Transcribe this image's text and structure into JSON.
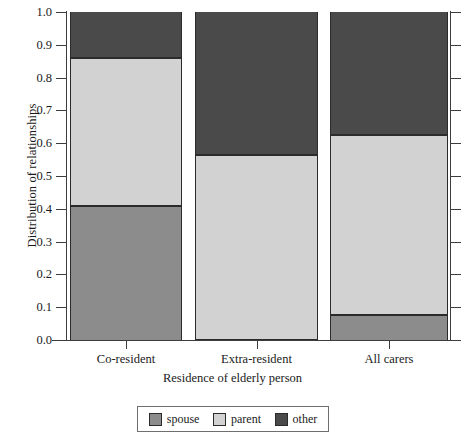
{
  "chart_data": {
    "type": "bar",
    "stacked": true,
    "title": "",
    "xlabel": "Residence of elderly person",
    "ylabel": "Distribution of relationships",
    "categories": [
      "Co-resident",
      "Extra-resident",
      "All carers"
    ],
    "ylim": [
      0.0,
      1.0
    ],
    "yticks": [
      "0.0",
      "0.1",
      "0.2",
      "0.3",
      "0.4",
      "0.5",
      "0.6",
      "0.7",
      "0.8",
      "0.9",
      "1.0"
    ],
    "ytick_values": [
      0.0,
      0.1,
      0.2,
      0.3,
      0.4,
      0.5,
      0.6,
      0.7,
      0.8,
      0.9,
      1.0
    ],
    "grid": false,
    "legend_position": "bottom",
    "series": [
      {
        "name": "spouse",
        "color": "#8c8c8c",
        "values": [
          0.41,
          0.0,
          0.075
        ]
      },
      {
        "name": "parent",
        "color": "#d2d2d2",
        "values": [
          0.45,
          0.565,
          0.55
        ]
      },
      {
        "name": "other",
        "color": "#4a4a4a",
        "values": [
          0.14,
          0.435,
          0.375
        ]
      }
    ],
    "cumulative_boundaries": [
      [
        0.41,
        0.86,
        1.0
      ],
      [
        0.0,
        0.565,
        1.0
      ],
      [
        0.075,
        0.625,
        1.0
      ]
    ]
  },
  "legend": {
    "items": [
      {
        "label": "spouse",
        "color": "#8c8c8c"
      },
      {
        "label": "parent",
        "color": "#d2d2d2"
      },
      {
        "label": "other",
        "color": "#4a4a4a"
      }
    ]
  },
  "axes": {
    "y_title": "Distribution of relationships",
    "x_title": "Residence of elderly person"
  }
}
